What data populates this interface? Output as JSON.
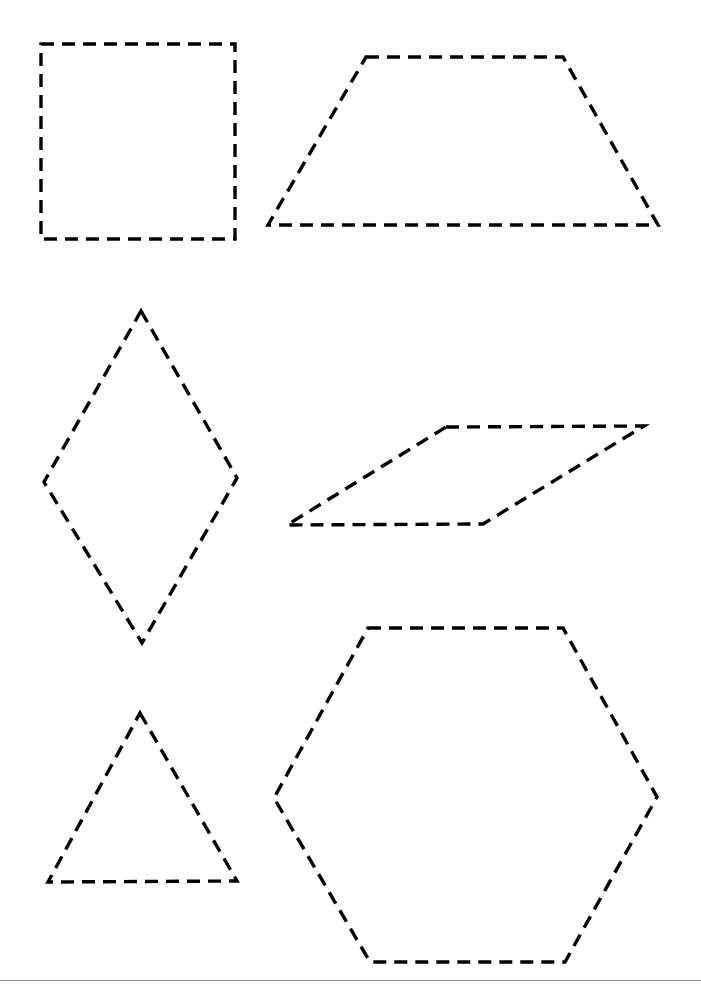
{
  "page": {
    "background_color": "#ffffff",
    "width": 701,
    "height": 993
  },
  "style": {
    "stroke_color": "#000000",
    "stroke_width": 3.4,
    "dash_length": 13,
    "dash_gap": 8,
    "fill": "none"
  },
  "shapes": [
    {
      "name": "square",
      "label": "Square",
      "sides": 4,
      "points": "41,44 235,44 235,239 41,239"
    },
    {
      "name": "trapezoid",
      "label": "Trapezoid",
      "sides": 4,
      "points": "366,57 563,57 658,225 268,225"
    },
    {
      "name": "rhombus",
      "label": "Rhombus",
      "sides": 4,
      "points": "141,311 237,478 142,643 44,482"
    },
    {
      "name": "parallelogram",
      "label": "Parallelogram",
      "sides": 4,
      "points": "446,427 644,426 483,524 287,525"
    },
    {
      "name": "triangle",
      "label": "Triangle",
      "sides": 3,
      "points": "140,713 237,881 48,882"
    },
    {
      "name": "hexagon",
      "label": "Hexagon",
      "sides": 6,
      "points": "368,628 563,628 657,797 565,962 370,962 274,798"
    }
  ],
  "footer": {
    "rule_color": "#8d8d8d",
    "rule_y": 980,
    "caption": ""
  }
}
